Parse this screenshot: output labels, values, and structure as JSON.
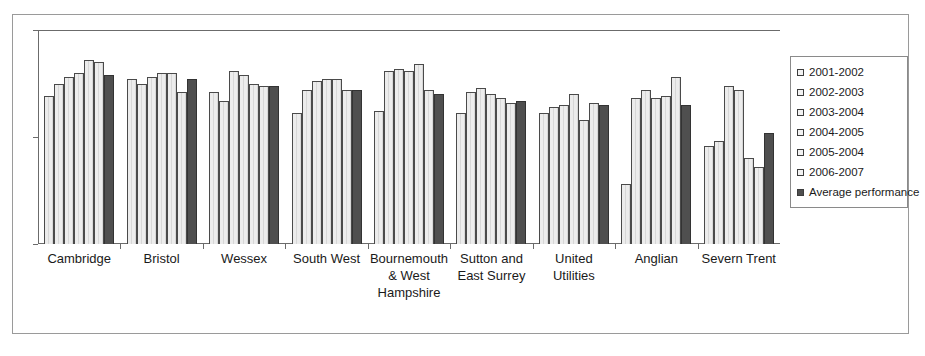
{
  "chart_title": "",
  "legend": {
    "position": "right",
    "entries": [
      {
        "label": "2001-2002",
        "swatch": "light"
      },
      {
        "label": "2002-2003",
        "swatch": "light"
      },
      {
        "label": "2003-2004",
        "swatch": "light"
      },
      {
        "label": "2004-2005",
        "swatch": "light"
      },
      {
        "label": "2005-2004",
        "swatch": "light"
      },
      {
        "label": "2006-2007",
        "swatch": "light"
      },
      {
        "label": "Average performance",
        "swatch": "dark"
      }
    ]
  },
  "colors": {
    "bar_light": "#ececec",
    "bar_light_outline": "#4a4a4a",
    "bar_average": "#4f4f4f",
    "axis": "#6b6b6b",
    "frame": "#9a9a9a",
    "text": "#1a1a1a"
  },
  "chart_data": {
    "type": "bar",
    "title": "",
    "xlabel": "",
    "ylabel": "",
    "ylim": [
      200,
      300
    ],
    "yticks": [
      200,
      250,
      300
    ],
    "grid": false,
    "legend_position": "right",
    "categories": [
      "Cambridge",
      "Bristol",
      "Wessex",
      "South West",
      "Bournemouth & West Hampshire",
      "Sutton and East Surrey",
      "United Utilities",
      "Anglian",
      "Severn Trent"
    ],
    "category_label_lines": [
      [
        "Cambridge"
      ],
      [
        "Bristol"
      ],
      [
        "Wessex"
      ],
      [
        "South West"
      ],
      [
        "Bournemouth",
        "& West",
        "Hampshire"
      ],
      [
        "Sutton and",
        "East Surrey"
      ],
      [
        "United",
        "Utilities"
      ],
      [
        "Anglian"
      ],
      [
        "Severn Trent"
      ]
    ],
    "series": [
      {
        "name": "2001-2002",
        "values": [
          269,
          277,
          271,
          261,
          262,
          261,
          261,
          228,
          246
        ]
      },
      {
        "name": "2002-2003",
        "values": [
          275,
          275,
          267,
          272,
          281,
          271,
          264,
          268,
          248
        ]
      },
      {
        "name": "2003-2004",
        "values": [
          278,
          278,
          281,
          276,
          282,
          273,
          265,
          272,
          274
        ]
      },
      {
        "name": "2004-2005",
        "values": [
          280,
          280,
          279,
          277,
          281,
          270,
          270,
          268,
          272
        ]
      },
      {
        "name": "2005-2004",
        "values": [
          286,
          280,
          275,
          277,
          284,
          268,
          258,
          269,
          240
        ]
      },
      {
        "name": "2006-2007",
        "values": [
          285,
          271,
          274,
          272,
          272,
          266,
          266,
          278,
          236
        ]
      },
      {
        "name": "Average performance",
        "values": [
          279,
          277,
          274,
          272,
          270,
          267,
          265,
          265,
          252
        ]
      }
    ]
  }
}
